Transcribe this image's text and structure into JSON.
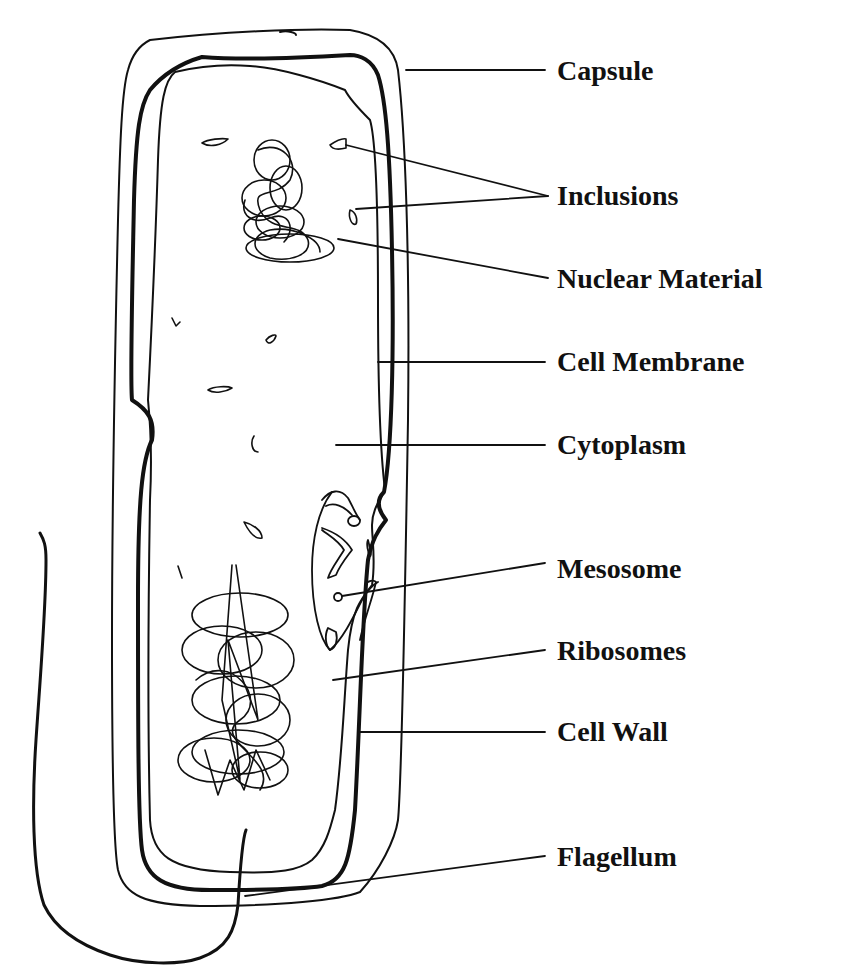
{
  "diagram": {
    "colors": {
      "ink": "#111111",
      "background": "#ffffff"
    },
    "labels": [
      {
        "id": "capsule",
        "text": "Capsule",
        "x": 557,
        "y": 57
      },
      {
        "id": "inclusions",
        "text": "Inclusions",
        "x": 557,
        "y": 182
      },
      {
        "id": "nuclear-material",
        "text": "Nuclear Material",
        "x": 557,
        "y": 265
      },
      {
        "id": "cell-membrane",
        "text": "Cell Membrane",
        "x": 557,
        "y": 348
      },
      {
        "id": "cytoplasm",
        "text": "Cytoplasm",
        "x": 557,
        "y": 431
      },
      {
        "id": "mesosome",
        "text": "Mesosome",
        "x": 557,
        "y": 555
      },
      {
        "id": "ribosomes",
        "text": "Ribosomes",
        "x": 557,
        "y": 637
      },
      {
        "id": "cell-wall",
        "text": "Cell Wall",
        "x": 557,
        "y": 718
      },
      {
        "id": "flagellum",
        "text": "Flagellum",
        "x": 557,
        "y": 843
      }
    ]
  }
}
